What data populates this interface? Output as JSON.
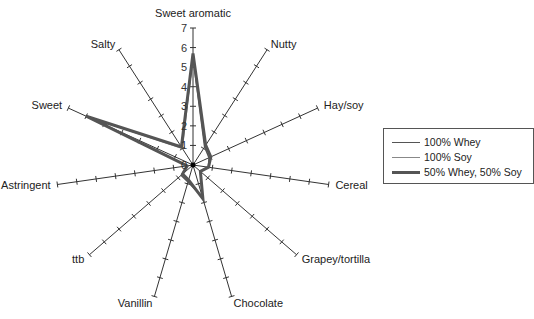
{
  "chart_data": {
    "type": "radar",
    "title": "",
    "axes": [
      "Sweet aromatic",
      "Nutty",
      "Hay/soy",
      "Cereal",
      "Grapey/tortilla",
      "Chocolate",
      "Vanillin",
      "ttb",
      "Astringent",
      "Sweet",
      "Salty"
    ],
    "rlim": [
      0,
      7
    ],
    "radial_ticks": [
      "0",
      "1",
      "2",
      "3",
      "4",
      "5",
      "6",
      "7"
    ],
    "series": [
      {
        "name": "100% Whey",
        "color": "#555555",
        "width": 1.5,
        "values": [
          5.5,
          1.1,
          0.9,
          0.8,
          0.5,
          1.7,
          0.9,
          0.8,
          0.3,
          5.9,
          1.1
        ]
      },
      {
        "name": "100% Soy",
        "color": "#888888",
        "width": 1.2,
        "values": [
          5.6,
          1.2,
          1.0,
          0.8,
          0.5,
          1.8,
          0.8,
          0.7,
          0.3,
          5.9,
          1.0
        ]
      },
      {
        "name": "50% Whey, 50% Soy",
        "color": "#555555",
        "width": 3,
        "values": [
          5.7,
          1.2,
          1.0,
          0.8,
          0.5,
          1.8,
          0.8,
          0.7,
          0.3,
          6.0,
          1.1
        ]
      }
    ],
    "legend_position": "right"
  },
  "legend": {
    "items": [
      "100% Whey",
      "100% Soy",
      "50% Whey, 50% Soy"
    ]
  }
}
